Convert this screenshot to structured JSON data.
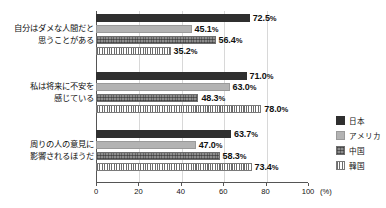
{
  "chart_data": {
    "type": "bar",
    "orientation": "horizontal",
    "title": "",
    "xlabel": "(%)",
    "ylabel": "",
    "xlim": [
      0,
      100
    ],
    "xticks": [
      0,
      20,
      40,
      60,
      80,
      100
    ],
    "grid": true,
    "legend_position": "right",
    "categories": [
      {
        "lines": [
          "自分はダメな人間だと",
          "思うことがある"
        ]
      },
      {
        "lines": [
          "私は将来に不安を",
          "感じている"
        ]
      },
      {
        "lines": [
          "周りの人の意見に",
          "影響されるほうだ"
        ]
      }
    ],
    "series": [
      {
        "name": "日本",
        "pattern": "solid-dark",
        "color": "#2f2f2f",
        "values": [
          72.5,
          71.0,
          63.7
        ]
      },
      {
        "name": "アメリカ",
        "pattern": "solid-light",
        "color": "#b3b3b3",
        "values": [
          45.1,
          63.0,
          47.0
        ]
      },
      {
        "name": "中国",
        "pattern": "cross-hatch",
        "color": "#8d8d8d",
        "values": [
          56.4,
          48.3,
          58.3
        ]
      },
      {
        "name": "韓国",
        "pattern": "vertical-stripe",
        "color": "#6b6b6b",
        "values": [
          35.2,
          78.0,
          73.4
        ]
      }
    ],
    "value_labels": [
      [
        "72.5",
        "45.1",
        "56.4",
        "35.2"
      ],
      [
        "71.0",
        "63.0",
        "48.3",
        "78.0"
      ],
      [
        "63.7",
        "47.0",
        "58.3",
        "73.4"
      ]
    ],
    "percent_suffix": "%"
  }
}
